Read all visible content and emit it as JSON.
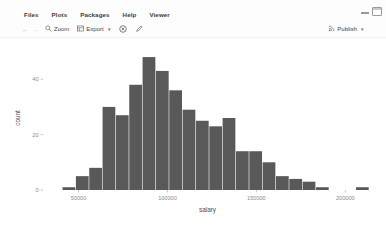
{
  "window": {
    "minimize_icon": "minimize-icon",
    "maximize_icon": "maximize-icon"
  },
  "menubar": {
    "items": [
      {
        "label": "Files"
      },
      {
        "label": "Plots"
      },
      {
        "label": "Packages"
      },
      {
        "label": "Help"
      },
      {
        "label": "Viewer"
      }
    ]
  },
  "toolbar": {
    "back_glyph": "←",
    "forward_glyph": "→",
    "zoom_label": "Zoom",
    "zoom_icon": "magnifier-icon",
    "export_label": "Export",
    "export_icon": "export-image-icon",
    "export_caret": "▾",
    "remove_icon": "remove-plot-icon",
    "clear_icon": "clear-all-plots-icon",
    "publish_label": "Publish",
    "publish_icon": "publish-icon",
    "publish_caret": "▾"
  },
  "colors": {
    "bar_fill": "#595959",
    "panel_bg": "#ffffff",
    "axis_text": "#8a8a8a",
    "axis_title": "#4d4d4d",
    "tick_mark": "#b0b0b0",
    "app_bg": "#fdfdfd"
  },
  "chart_data": {
    "type": "bar",
    "title": "",
    "subtitle": "",
    "xlabel": "salary",
    "ylabel": "count",
    "grid": false,
    "legend": "none",
    "xlim": [
      30000,
      215000
    ],
    "ylim": [
      0,
      52
    ],
    "xticks": [
      50000,
      100000,
      150000,
      200000
    ],
    "xtick_labels": [
      "50000",
      "100000",
      "150000",
      "200000"
    ],
    "yticks": [
      0,
      20,
      40
    ],
    "ytick_labels": [
      "0",
      "20",
      "40"
    ],
    "bin_width": 7500,
    "bin_starts": [
      41000,
      48500,
      56000,
      63500,
      71000,
      78500,
      86000,
      93500,
      101000,
      108500,
      116000,
      123500,
      131000,
      138500,
      146000,
      153500,
      161000,
      168500,
      176000,
      183500,
      191000,
      206000
    ],
    "categories": [
      "41000",
      "48500",
      "56000",
      "63500",
      "71000",
      "78500",
      "86000",
      "93500",
      "101000",
      "108500",
      "116000",
      "123500",
      "131000",
      "138500",
      "146000",
      "153500",
      "161000",
      "168500",
      "176000",
      "183500",
      "191000",
      "206000"
    ],
    "values": [
      1,
      5,
      8,
      30,
      27,
      38,
      48,
      43,
      36,
      29,
      25,
      23,
      26,
      14,
      14,
      10,
      5,
      4,
      3,
      1,
      0,
      1
    ]
  }
}
